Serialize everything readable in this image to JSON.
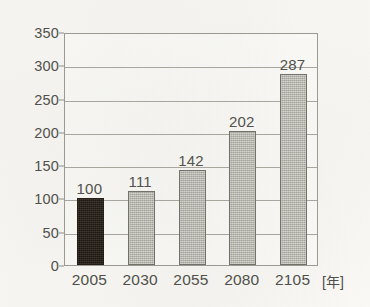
{
  "chart_data": {
    "type": "bar",
    "title": "",
    "subtitle": "",
    "xlabel": "年",
    "ylabel": "",
    "categories": [
      "2005",
      "2030",
      "2055",
      "2080",
      "2105"
    ],
    "values": [
      100,
      111,
      142,
      202,
      287
    ],
    "value_labels": [
      "100",
      "111",
      "142",
      "202",
      "287"
    ],
    "ylim": [
      0,
      350
    ],
    "y_ticks": [
      0,
      50,
      100,
      150,
      200,
      250,
      300,
      350
    ],
    "y_tick_labels": [
      "0",
      "50",
      "100",
      "150",
      "200",
      "250",
      "300",
      "350"
    ],
    "grid": "horizontal",
    "legend": "none",
    "series": [
      {
        "name": "",
        "values": [
          100,
          111,
          142,
          202,
          287
        ],
        "bar_colors": [
          "#241a14",
          "#b6b6ae",
          "#b6b6ae",
          "#b6b6ae",
          "#b6b6ae"
        ],
        "bar_styles": [
          "dark",
          "gray",
          "gray",
          "gray",
          "gray"
        ]
      }
    ]
  },
  "axis": {
    "x_unit_label": "[年]",
    "x_unit_bracket_open": "[",
    "x_unit_bracket_close": "]"
  },
  "colors": {
    "background": "#fbfaf7",
    "plot_background": "#fdfdfb",
    "frame": "#9a9a93",
    "gridline": "#a8a8a0",
    "text": "#4a4a46",
    "bar_highlight": "#241a14",
    "bar_default": "#b6b6ae",
    "bar_border": "#6e6e66"
  }
}
